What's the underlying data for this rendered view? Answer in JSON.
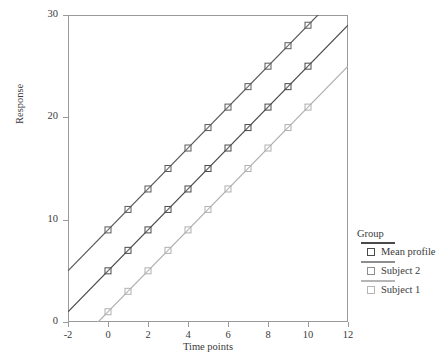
{
  "chart_data": {
    "type": "line",
    "title": "",
    "xlabel": "Time points",
    "ylabel": "Response",
    "xlim": [
      -2,
      12
    ],
    "ylim": [
      0,
      30
    ],
    "xticks": [
      "-2",
      "0",
      "2",
      "4",
      "6",
      "8",
      "10",
      "12"
    ],
    "xtick_values": [
      -2,
      0,
      2,
      4,
      6,
      8,
      10,
      12
    ],
    "yticks": [
      "0",
      "10",
      "20",
      "30"
    ],
    "ytick_values": [
      0,
      10,
      20,
      30
    ],
    "grid": false,
    "legend_position": "right",
    "legend_title": "Group",
    "x": [
      0,
      1,
      2,
      3,
      4,
      5,
      6,
      7,
      8,
      9,
      10
    ],
    "series": [
      {
        "name": "Subject 2",
        "color": "#5a5a5a",
        "intercept": 9,
        "slope": 2,
        "line_from": [
          -2,
          5
        ],
        "line_to": [
          12,
          33
        ],
        "values": [
          9,
          11,
          13,
          15,
          17,
          19,
          21,
          23,
          25,
          27,
          29
        ]
      },
      {
        "name": "Mean profile",
        "color": "#4a4a4a",
        "intercept": 5,
        "slope": 2,
        "line_from": [
          -2,
          1
        ],
        "line_to": [
          12,
          29
        ],
        "values": [
          5,
          7,
          9,
          11,
          13,
          15,
          17,
          19,
          21,
          23,
          25
        ]
      },
      {
        "name": "Subject 1",
        "color": "#b0b0b0",
        "intercept": 1,
        "slope": 2,
        "line_from": [
          -2,
          -3
        ],
        "line_to": [
          12,
          25
        ],
        "values": [
          1,
          3,
          5,
          7,
          9,
          11,
          13,
          15,
          17,
          19,
          21
        ]
      }
    ]
  },
  "legend": {
    "title": "Group",
    "entries": [
      {
        "label": "Mean profile",
        "color": "#4a4a4a"
      },
      {
        "label": "Subject 2",
        "color": "#8d8d8d"
      },
      {
        "label": "Subject 1",
        "color": "#b5b5b5"
      }
    ]
  },
  "axes": {
    "x_title": "Time points",
    "y_title": "Response"
  }
}
